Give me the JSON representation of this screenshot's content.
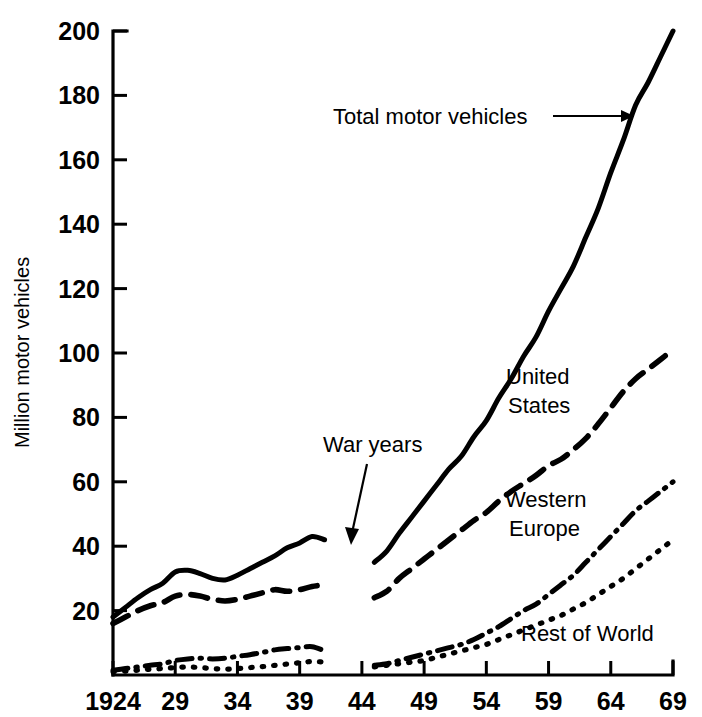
{
  "chart_data": {
    "type": "line",
    "title": "",
    "xlabel": "",
    "ylabel": "Million motor vehicles",
    "xlim": [
      1924,
      1969
    ],
    "ylim": [
      0,
      200
    ],
    "grid": false,
    "legend_position": "inline-labels",
    "x_tick_labels": [
      "1924",
      "29",
      "34",
      "39",
      "44",
      "49",
      "54",
      "59",
      "64",
      "69"
    ],
    "x_tick_values": [
      1924,
      1929,
      1934,
      1939,
      1944,
      1949,
      1954,
      1959,
      1964,
      1969
    ],
    "y_tick_labels": [
      "20",
      "40",
      "60",
      "80",
      "100",
      "120",
      "140",
      "160",
      "180",
      "200"
    ],
    "y_tick_values": [
      20,
      40,
      60,
      80,
      100,
      120,
      140,
      160,
      180,
      200
    ],
    "annotations": [
      {
        "name": "total-motor-vehicles-annotation",
        "text": "Total motor vehicles",
        "points_to_year": 1964,
        "points_to_value": 178
      },
      {
        "name": "war-years-annotation",
        "text": "War years",
        "points_to_year": 1943,
        "points_to_value": 35
      }
    ],
    "series": [
      {
        "name": "Total motor vehicles",
        "style": "solid",
        "label_text": "Total motor vehicles",
        "x": [
          1924,
          1925,
          1926,
          1927,
          1928,
          1929,
          1930,
          1931,
          1932,
          1933,
          1934,
          1935,
          1936,
          1937,
          1938,
          1939,
          1940,
          1941,
          1945,
          1946,
          1947,
          1948,
          1949,
          1950,
          1951,
          1952,
          1953,
          1954,
          1955,
          1956,
          1957,
          1958,
          1959,
          1960,
          1961,
          1962,
          1963,
          1964,
          1965,
          1966,
          1967,
          1968,
          1969
        ],
        "values": [
          18,
          21,
          24,
          26.5,
          28.5,
          32,
          32.5,
          31.5,
          30,
          29.5,
          31,
          33,
          35,
          37,
          39.5,
          41,
          43,
          42,
          35,
          38.5,
          44,
          49,
          54,
          59,
          64,
          68,
          74,
          79,
          86,
          92,
          99,
          105,
          113,
          120,
          127,
          136,
          145,
          156,
          166,
          177,
          184,
          192,
          200
        ]
      },
      {
        "name": "United States",
        "style": "dashed",
        "label_text": "United States",
        "x": [
          1924,
          1925,
          1926,
          1927,
          1928,
          1929,
          1930,
          1931,
          1932,
          1933,
          1934,
          1935,
          1936,
          1937,
          1938,
          1939,
          1940,
          1941,
          1945,
          1946,
          1947,
          1948,
          1949,
          1950,
          1951,
          1952,
          1953,
          1954,
          1955,
          1956,
          1957,
          1958,
          1959,
          1960,
          1961,
          1962,
          1963,
          1964,
          1965,
          1966,
          1967,
          1968,
          1969
        ],
        "values": [
          16,
          18,
          20,
          21.5,
          22.5,
          24.5,
          25,
          24.5,
          23.5,
          23,
          23.5,
          24.5,
          25.5,
          26.5,
          26,
          26.5,
          27.5,
          28,
          24,
          26,
          30,
          33,
          36,
          39,
          42,
          45,
          48,
          50.5,
          54,
          57,
          59.5,
          62,
          65,
          67,
          70,
          73.5,
          78,
          83,
          88,
          92,
          95,
          98,
          101
        ]
      },
      {
        "name": "Western Europe",
        "style": "dash-dot",
        "label_text": "Western Europe",
        "x": [
          1924,
          1925,
          1926,
          1927,
          1928,
          1929,
          1930,
          1931,
          1932,
          1933,
          1934,
          1935,
          1936,
          1937,
          1938,
          1939,
          1940,
          1941,
          1945,
          1946,
          1947,
          1948,
          1949,
          1950,
          1951,
          1952,
          1953,
          1954,
          1955,
          1956,
          1957,
          1958,
          1959,
          1960,
          1961,
          1962,
          1963,
          1964,
          1965,
          1966,
          1967,
          1968,
          1969
        ],
        "values": [
          1.5,
          2,
          2.5,
          3,
          3.5,
          4.5,
          5,
          5.2,
          5,
          5.2,
          5.8,
          6.3,
          7,
          7.8,
          8.2,
          8.5,
          8.8,
          7.5,
          3,
          3.5,
          4.5,
          5.5,
          6.5,
          7.5,
          8.5,
          9.5,
          11,
          13,
          15,
          17.5,
          20,
          22,
          25,
          28,
          31,
          35,
          39,
          43,
          47,
          51,
          54,
          57,
          60
        ]
      },
      {
        "name": "Rest of World",
        "style": "dotted",
        "label_text": "Rest of World",
        "x": [
          1924,
          1925,
          1926,
          1927,
          1928,
          1929,
          1930,
          1931,
          1932,
          1933,
          1934,
          1935,
          1936,
          1937,
          1938,
          1939,
          1940,
          1941,
          1945,
          1946,
          1947,
          1948,
          1949,
          1950,
          1951,
          1952,
          1953,
          1954,
          1955,
          1956,
          1957,
          1958,
          1959,
          1960,
          1961,
          1962,
          1963,
          1964,
          1965,
          1966,
          1967,
          1968,
          1969
        ],
        "values": [
          1,
          1.2,
          1.5,
          1.8,
          2,
          2.3,
          2.5,
          2.3,
          2,
          1.8,
          2,
          2.3,
          2.6,
          3,
          3.4,
          3.8,
          4.2,
          4,
          2.5,
          3,
          3.5,
          4,
          4.5,
          5.5,
          6.5,
          7.5,
          8.5,
          9.5,
          11,
          12.5,
          14,
          15.5,
          17,
          18.5,
          20.5,
          22.5,
          25,
          27.5,
          30,
          33,
          36,
          39,
          42
        ]
      }
    ]
  },
  "style": {
    "line_color": "#000000",
    "background": "#ffffff"
  }
}
